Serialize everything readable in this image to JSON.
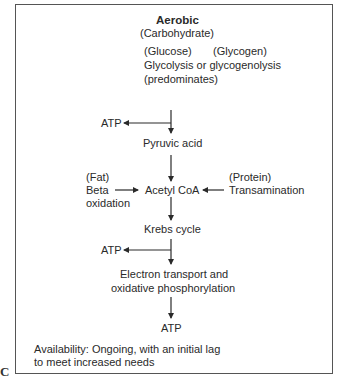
{
  "figure": {
    "panel_label": "C",
    "title": "Aerobic",
    "subtitle": "(Carbohydrate)",
    "sources": {
      "glucose": "(Glucose)",
      "glycogen": "(Glycogen)",
      "process_line1": "Glycolysis or glycogenolysis",
      "process_line2": "(predominates)"
    },
    "nodes": {
      "atp_1": "ATP",
      "pyruvic_acid": "Pyruvic acid",
      "fat_label": "(Fat)",
      "beta": "Beta",
      "oxidation": "oxidation",
      "acetyl_coa": "Acetyl CoA",
      "protein_label": "(Protein)",
      "transamination": "Transamination",
      "krebs_cycle": "Krebs cycle",
      "atp_2": "ATP",
      "etc_line1": "Electron transport and",
      "etc_line2": "oxidative phosphorylation",
      "atp_final": "ATP"
    },
    "availability": {
      "line1": "Availability: Ongoing, with an initial lag",
      "line2": "to meet increased needs"
    },
    "colors": {
      "line": "#2a2a2a",
      "border": "#555555",
      "background": "#ffffff"
    }
  }
}
